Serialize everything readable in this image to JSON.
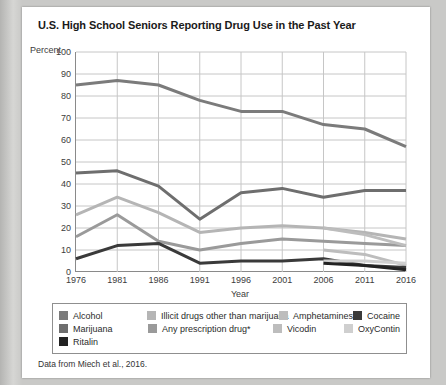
{
  "title": "U.S. High School Seniors Reporting Drug Use in the Past Year",
  "caption": "Data from Miech et al., 2016.",
  "chart_data": {
    "type": "line",
    "title": "U.S. High School Seniors Reporting Drug Use in the Past Year",
    "xlabel": "Year",
    "ylabel": "Percent",
    "xlim": [
      1976,
      2016
    ],
    "ylim": [
      0,
      100
    ],
    "grid": true,
    "legend_position": "bottom",
    "x": [
      1976,
      1981,
      1986,
      1991,
      1996,
      2001,
      2006,
      2011,
      2016
    ],
    "xticklabels": [
      "1976",
      "1981",
      "1986",
      "1991",
      "1996",
      "2001",
      "2006",
      "2011",
      "2016"
    ],
    "yticks": [
      0,
      10,
      20,
      30,
      40,
      50,
      60,
      70,
      80,
      90,
      100
    ],
    "yticklabels": [
      "0",
      "10",
      "20",
      "30",
      "40",
      "50",
      "60",
      "70",
      "80",
      "90",
      "100"
    ],
    "series": [
      {
        "name": "Alcohol",
        "color": "#7b7b7b",
        "x": [
          1976,
          1981,
          1986,
          1991,
          1996,
          2001,
          2006,
          2011,
          2016
        ],
        "values": [
          85,
          87,
          85,
          78,
          73,
          73,
          67,
          65,
          57
        ]
      },
      {
        "name": "Marijuana",
        "color": "#6e6e6e",
        "x": [
          1976,
          1981,
          1986,
          1991,
          1996,
          2001,
          2006,
          2011,
          2016
        ],
        "values": [
          45,
          46,
          39,
          24,
          36,
          38,
          34,
          37,
          37
        ]
      },
      {
        "name": "Illicit drugs other than marijuana",
        "color": "#b5b5b5",
        "x": [
          1976,
          1981,
          1986,
          1991,
          1996,
          2001,
          2006,
          2011,
          2016
        ],
        "values": [
          26,
          34,
          27,
          18,
          20,
          21,
          20,
          18,
          15
        ]
      },
      {
        "name": "Any prescription drug*",
        "color": "#9a9a9a",
        "x": [
          1976,
          1981,
          1986,
          1991,
          1996,
          2001,
          2006,
          2011,
          2016
        ],
        "values": [
          16,
          26,
          14,
          10,
          13,
          15,
          14,
          13,
          12
        ]
      },
      {
        "name": "Amphetamines",
        "color": "#bdbdbd",
        "x": [
          2006,
          2011,
          2016
        ],
        "values": [
          20,
          17,
          12
        ]
      },
      {
        "name": "Vicodin",
        "color": "#bdbdbd",
        "x": [
          2006,
          2011,
          2016
        ],
        "values": [
          10,
          8,
          3
        ]
      },
      {
        "name": "Cocaine",
        "color": "#3a3a3a",
        "x": [
          1976,
          1981,
          1986,
          1991,
          1996,
          2001,
          2006,
          2011,
          2016
        ],
        "values": [
          6,
          12,
          13,
          4,
          5,
          5,
          6,
          3,
          2
        ]
      },
      {
        "name": "OxyContin",
        "color": "#cfcfcf",
        "x": [
          2006,
          2011,
          2016
        ],
        "values": [
          5,
          5,
          4
        ]
      },
      {
        "name": "Ritalin",
        "color": "#222222",
        "x": [
          2006,
          2011,
          2016
        ],
        "values": [
          4,
          3,
          1
        ]
      }
    ]
  },
  "legend": {
    "rows": [
      [
        {
          "label": "Alcohol",
          "color": "#7b7b7b"
        },
        {
          "label": "Illicit drugs other than marijuana",
          "color": "#b5b5b5"
        },
        {
          "label": "Amphetamines",
          "color": "#bdbdbd"
        },
        {
          "label": "Cocaine",
          "color": "#3a3a3a"
        }
      ],
      [
        {
          "label": "Marijuana",
          "color": "#6e6e6e"
        },
        {
          "label": "Any prescription drug*",
          "color": "#9a9a9a"
        },
        {
          "label": "Vicodin",
          "color": "#bdbdbd"
        },
        {
          "label": "OxyContin",
          "color": "#cfcfcf"
        }
      ],
      [
        {
          "label": "Ritalin",
          "color": "#222222"
        }
      ]
    ]
  }
}
